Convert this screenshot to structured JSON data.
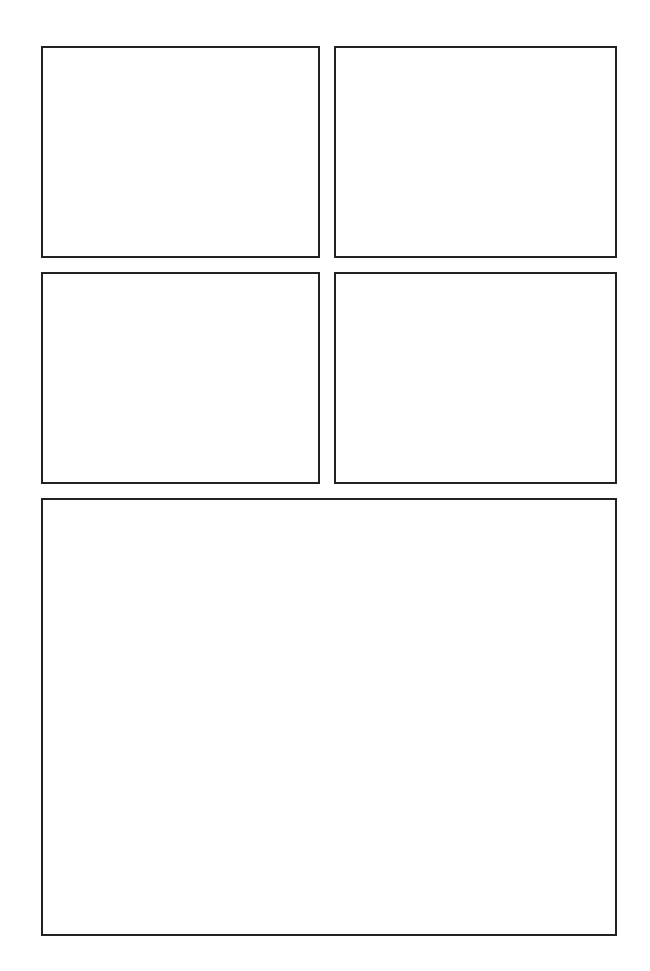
{
  "page": {
    "layout": "comic-panel-grid",
    "background": "#ffffff",
    "border_color": "#222222",
    "panels": [
      {
        "id": 1,
        "row": 1,
        "col": 1,
        "content": ""
      },
      {
        "id": 2,
        "row": 1,
        "col": 2,
        "content": ""
      },
      {
        "id": 3,
        "row": 2,
        "col": 1,
        "content": ""
      },
      {
        "id": 4,
        "row": 2,
        "col": 2,
        "content": ""
      },
      {
        "id": 5,
        "row": 3,
        "col": "1-2",
        "content": ""
      }
    ]
  }
}
